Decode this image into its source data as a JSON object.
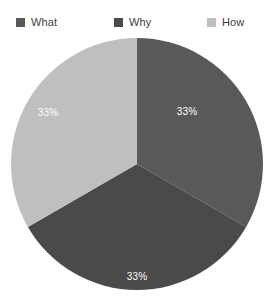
{
  "chart_data": {
    "type": "pie",
    "title": "",
    "subtitle": "",
    "xlabel": "",
    "ylabel": "",
    "legend_position": "top",
    "grid": false,
    "categories": [
      "What",
      "Why",
      "How"
    ],
    "values": [
      33,
      33,
      33
    ],
    "value_labels": [
      "33%",
      "33%",
      "33%"
    ],
    "colors": [
      "#595959",
      "#4a4a4a",
      "#bfbfbf"
    ],
    "slices": [
      {
        "label": "What",
        "value": 33,
        "value_label": "33%",
        "color": "#595959",
        "start_angle": 0,
        "end_angle": 120,
        "label_x": 178,
        "label_y": 76
      },
      {
        "label": "Why",
        "value": 33,
        "value_label": "33%",
        "color": "#4a4a4a",
        "start_angle": 120,
        "end_angle": 240,
        "label_x": 128,
        "label_y": 241
      },
      {
        "label": "How",
        "value": 33,
        "value_label": "33%",
        "color": "#bfbfbf",
        "start_angle": 240,
        "end_angle": 360,
        "label_x": 39,
        "label_y": 77
      }
    ]
  },
  "legend": {
    "items": [
      {
        "label": "What",
        "color": "#595959",
        "swatch_icon": "legend-swatch-icon"
      },
      {
        "label": "Why",
        "color": "#4a4a4a",
        "swatch_icon": "legend-swatch-icon"
      },
      {
        "label": "How",
        "color": "#bfbfbf",
        "swatch_icon": "legend-swatch-icon"
      }
    ]
  },
  "pie_geometry": {
    "center_x": 128,
    "center_y": 128,
    "radius": 126
  }
}
